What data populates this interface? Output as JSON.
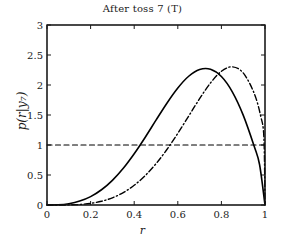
{
  "chart_data": {
    "type": "line",
    "title": "After toss 7 (T)",
    "title_parts": {
      "main": "After toss 7 (T)"
    },
    "xlabel": "r",
    "ylabel": "p(r|y7)",
    "ylabel_parts": {
      "prefix": "p(r|y",
      "sub": "7",
      "suffix": ")"
    },
    "xlim": [
      0,
      1
    ],
    "ylim": [
      0,
      3
    ],
    "xticks": [
      0,
      0.2,
      0.4,
      0.6,
      0.8,
      1
    ],
    "xticklabels": [
      "0",
      "0.2",
      "0.4",
      "0.6",
      "0.8",
      "1"
    ],
    "yticks": [
      0,
      0.5,
      1,
      1.5,
      2,
      2.5,
      3
    ],
    "yticklabels": [
      "0",
      "0.5",
      "1",
      "1.5",
      "2",
      "2.5",
      "3"
    ],
    "grid": false,
    "legend": "none",
    "box": true,
    "tick_direction": "in",
    "series": [
      {
        "name": "posterior-solid",
        "style": "solid",
        "color": "#000000",
        "width": 1.6,
        "peak_x": 0.71,
        "peak_y": 2.55,
        "crosses_one_at": [
          0.45,
          0.96
        ],
        "x": [
          0.0,
          0.05,
          0.1,
          0.15,
          0.2,
          0.25,
          0.3,
          0.35,
          0.4,
          0.45,
          0.5,
          0.55,
          0.6,
          0.65,
          0.7,
          0.75,
          0.8,
          0.85,
          0.9,
          0.95,
          0.975,
          1.0
        ],
        "y": [
          0.0,
          0.003,
          0.022,
          0.065,
          0.14,
          0.254,
          0.411,
          0.612,
          0.854,
          1.126,
          1.414,
          1.697,
          1.95,
          2.146,
          2.258,
          2.262,
          2.141,
          1.886,
          1.498,
          0.983,
          0.675,
          0.0
        ]
      },
      {
        "name": "posterior-dashdot",
        "style": "dashdot",
        "color": "#000000",
        "width": 1.4,
        "peak_x": 0.83,
        "peak_y": 2.82,
        "crosses_one_at": [
          0.55,
          0.99
        ],
        "x": [
          0.0,
          0.05,
          0.1,
          0.15,
          0.2,
          0.25,
          0.3,
          0.35,
          0.4,
          0.45,
          0.5,
          0.55,
          0.6,
          0.65,
          0.7,
          0.75,
          0.8,
          0.85,
          0.9,
          0.95,
          0.98,
          0.995,
          1.0
        ],
        "y": [
          0.0,
          0.0,
          0.002,
          0.009,
          0.027,
          0.062,
          0.12,
          0.207,
          0.329,
          0.489,
          0.688,
          0.925,
          1.193,
          1.482,
          1.772,
          2.034,
          2.228,
          2.303,
          2.202,
          1.865,
          1.486,
          1.12,
          0.0
        ]
      },
      {
        "name": "reference-line-one",
        "style": "dashed",
        "color": "#000000",
        "width": 1.2,
        "constant_y": 1,
        "x": [
          0,
          1
        ],
        "y": [
          1,
          1
        ]
      }
    ]
  }
}
